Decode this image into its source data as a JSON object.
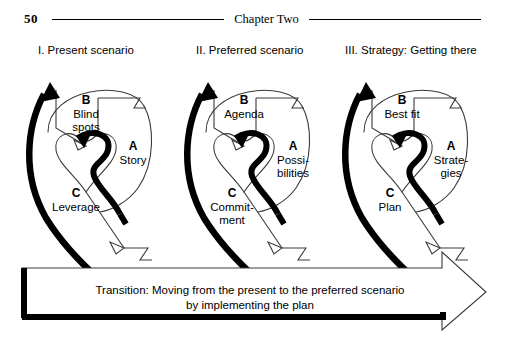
{
  "page": {
    "folio": "50",
    "running_head": "Chapter Two"
  },
  "panels": [
    {
      "caption": "I. Present scenario",
      "a": {
        "letter": "A",
        "lines": [
          "Story"
        ]
      },
      "b": {
        "letter": "B",
        "lines": [
          "Blind",
          "spots"
        ]
      },
      "c": {
        "letter": "C",
        "lines": [
          "Leverage"
        ]
      }
    },
    {
      "caption": "II. Preferred scenario",
      "a": {
        "letter": "A",
        "lines": [
          "Possi-",
          "bilities"
        ]
      },
      "b": {
        "letter": "B",
        "lines": [
          "Agenda"
        ]
      },
      "c": {
        "letter": "C",
        "lines": [
          "Commit-",
          "ment"
        ]
      }
    },
    {
      "caption": "III. Strategy: Getting there",
      "a": {
        "letter": "A",
        "lines": [
          "Strate-",
          "gies"
        ]
      },
      "b": {
        "letter": "B",
        "lines": [
          "Best fit"
        ]
      },
      "c": {
        "letter": "C",
        "lines": [
          "Plan"
        ]
      }
    }
  ],
  "transition": {
    "line1": "Transition: Moving from the present to the preferred scenario",
    "line2": "by implementing the plan"
  },
  "colors": {
    "ink": "#000000",
    "paper": "#ffffff",
    "thin_stroke": "#3a3a3a"
  }
}
